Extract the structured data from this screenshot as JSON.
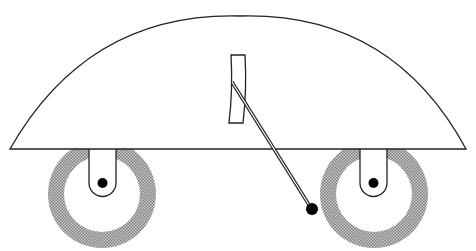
{
  "diagram": {
    "colors": {
      "stroke": "#222222",
      "fill": "#ffffff",
      "tire_hatch": "#8a8a8a",
      "ball": "#000000"
    },
    "components": [
      {
        "name": "dome-body"
      },
      {
        "name": "left-wheel"
      },
      {
        "name": "right-wheel"
      },
      {
        "name": "curved-plate"
      },
      {
        "name": "pendulum-rod"
      },
      {
        "name": "pendulum-ball"
      }
    ]
  }
}
